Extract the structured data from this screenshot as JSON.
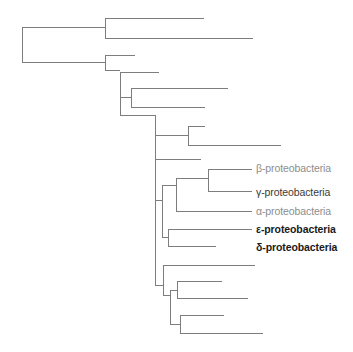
{
  "figure": {
    "type": "phylogenetic-tree",
    "orientation": "left-to-right-rectangular-cladogram",
    "background_color": "#ffffff",
    "branch_color": "#7d7d7d",
    "branch_width": 1
  },
  "labels": [
    {
      "id": "beta",
      "text": "β-proteobacteria",
      "color": "#8d8d8d",
      "weight": "light",
      "x": 256,
      "y": 163
    },
    {
      "id": "gamma",
      "text": "γ-proteobacteria",
      "color": "#3a3a3a",
      "weight": "medium",
      "x": 256,
      "y": 187
    },
    {
      "id": "alpha",
      "text": "α-proteobacteria",
      "color": "#8d8d8d",
      "weight": "light",
      "x": 256,
      "y": 206
    },
    {
      "id": "epsilon",
      "text": "ε-proteobacteria",
      "color": "#1a1a1a",
      "weight": "bold",
      "x": 256,
      "y": 224
    },
    {
      "id": "delta",
      "text": "δ-proteobacteria",
      "color": "#1a1a1a",
      "weight": "bold",
      "x": 256,
      "y": 242
    }
  ],
  "chart_data": {
    "type": "tree",
    "title": "",
    "xlabel": "",
    "ylabel": "",
    "leaf_count": 19,
    "named_leaves": [
      "β-proteobacteria",
      "γ-proteobacteria",
      "α-proteobacteria",
      "ε-proteobacteria",
      "δ-proteobacteria"
    ],
    "horizontal_branches": [
      {
        "id": "h-root-stem",
        "x1": 22,
        "x2": 22,
        "y": 45
      },
      {
        "id": "h-cladeA-stem",
        "x1": 22,
        "x2": 105,
        "y": 27
      },
      {
        "id": "h-cladeA-tip1",
        "x1": 105,
        "x2": 204,
        "y": 18
      },
      {
        "id": "h-cladeA-tip2",
        "x1": 105,
        "x2": 253,
        "y": 38
      },
      {
        "id": "h-cladeB-stem",
        "x1": 22,
        "x2": 105,
        "y": 62
      },
      {
        "id": "h-cladeB-tip1",
        "x1": 105,
        "x2": 135,
        "y": 55
      },
      {
        "id": "h-nodeC-stem",
        "x1": 105,
        "x2": 120,
        "y": 70
      },
      {
        "id": "h-nodeC-tip1",
        "x1": 120,
        "x2": 159,
        "y": 72
      },
      {
        "id": "h-nodeD-stem",
        "x1": 120,
        "x2": 131,
        "y": 97
      },
      {
        "id": "h-nodeD-tip1",
        "x1": 131,
        "x2": 228,
        "y": 88
      },
      {
        "id": "h-nodeD-tip2",
        "x1": 131,
        "x2": 205,
        "y": 107
      },
      {
        "id": "h-nodeE-stem",
        "x1": 120,
        "x2": 155,
        "y": 115
      },
      {
        "id": "h-nodeF-stem",
        "x1": 155,
        "x2": 188,
        "y": 135
      },
      {
        "id": "h-nodeF-tip1",
        "x1": 188,
        "x2": 205,
        "y": 126
      },
      {
        "id": "h-nodeF-tip2",
        "x1": 188,
        "x2": 281,
        "y": 145
      },
      {
        "id": "h-nodeE-tip1",
        "x1": 155,
        "x2": 201,
        "y": 159
      },
      {
        "id": "h-nodeG-stem",
        "x1": 155,
        "x2": 162,
        "y": 200
      },
      {
        "id": "h-nodeH-stem",
        "x1": 162,
        "x2": 176,
        "y": 185
      },
      {
        "id": "h-nodeI-stem",
        "x1": 176,
        "x2": 208,
        "y": 178
      },
      {
        "id": "h-tip-beta",
        "x1": 208,
        "x2": 252,
        "y": 169
      },
      {
        "id": "h-tip-gamma",
        "x1": 208,
        "x2": 252,
        "y": 191
      },
      {
        "id": "h-tip-alpha",
        "x1": 176,
        "x2": 252,
        "y": 211
      },
      {
        "id": "h-nodeJ-stem",
        "x1": 162,
        "x2": 168,
        "y": 237
      },
      {
        "id": "h-tip-epsilon",
        "x1": 168,
        "x2": 252,
        "y": 229
      },
      {
        "id": "h-tip-delta",
        "x1": 168,
        "x2": 216,
        "y": 246
      },
      {
        "id": "h-nodeK-stem",
        "x1": 155,
        "x2": 163,
        "y": 285
      },
      {
        "id": "h-nodeK-tip1",
        "x1": 163,
        "x2": 255,
        "y": 265
      },
      {
        "id": "h-nodeL-stem",
        "x1": 163,
        "x2": 170,
        "y": 295
      },
      {
        "id": "h-nodeM-stem",
        "x1": 170,
        "x2": 177,
        "y": 290
      },
      {
        "id": "h-nodeM-tip1",
        "x1": 177,
        "x2": 222,
        "y": 281
      },
      {
        "id": "h-nodeM-tip2",
        "x1": 177,
        "x2": 248,
        "y": 298
      },
      {
        "id": "h-nodeN-stem",
        "x1": 170,
        "x2": 180,
        "y": 324
      },
      {
        "id": "h-nodeN-tip1",
        "x1": 180,
        "x2": 224,
        "y": 315
      },
      {
        "id": "h-nodeN-tip2",
        "x1": 180,
        "x2": 263,
        "y": 333
      }
    ],
    "vertical_branches": [
      {
        "id": "v-root",
        "x": 22,
        "y1": 27,
        "y2": 62
      },
      {
        "id": "v-cladeA",
        "x": 105,
        "y1": 18,
        "y2": 38
      },
      {
        "id": "v-cladeB",
        "x": 105,
        "y1": 55,
        "y2": 70
      },
      {
        "id": "v-nodeC",
        "x": 120,
        "y1": 72,
        "y2": 115
      },
      {
        "id": "v-nodeD",
        "x": 131,
        "y1": 88,
        "y2": 107
      },
      {
        "id": "v-nodeE",
        "x": 155,
        "y1": 115,
        "y2": 200
      },
      {
        "id": "v-nodeF",
        "x": 188,
        "y1": 126,
        "y2": 145
      },
      {
        "id": "v-nodeE2",
        "x": 155,
        "y1": 200,
        "y2": 285
      },
      {
        "id": "v-nodeG",
        "x": 162,
        "y1": 185,
        "y2": 237
      },
      {
        "id": "v-nodeH",
        "x": 176,
        "y1": 178,
        "y2": 211
      },
      {
        "id": "v-nodeI",
        "x": 208,
        "y1": 169,
        "y2": 191
      },
      {
        "id": "v-nodeJ",
        "x": 168,
        "y1": 229,
        "y2": 246
      },
      {
        "id": "v-nodeK",
        "x": 163,
        "y1": 265,
        "y2": 295
      },
      {
        "id": "v-nodeL",
        "x": 170,
        "y1": 290,
        "y2": 324
      },
      {
        "id": "v-nodeM",
        "x": 177,
        "y1": 281,
        "y2": 298
      },
      {
        "id": "v-nodeN",
        "x": 180,
        "y1": 315,
        "y2": 333
      }
    ]
  }
}
